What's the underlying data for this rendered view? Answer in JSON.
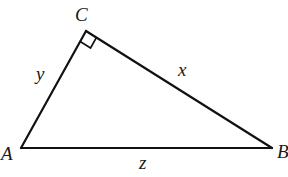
{
  "diagram": {
    "type": "right-triangle",
    "vertices": {
      "A": {
        "label": "A",
        "x": 21,
        "y": 148
      },
      "B": {
        "label": "B",
        "x": 272,
        "y": 148
      },
      "C": {
        "label": "C",
        "x": 86,
        "y": 31
      }
    },
    "sides": {
      "AC": {
        "label": "y"
      },
      "CB": {
        "label": "x"
      },
      "AB": {
        "label": "z"
      }
    },
    "right_angle_at": "C",
    "stroke_color": "#111111"
  }
}
